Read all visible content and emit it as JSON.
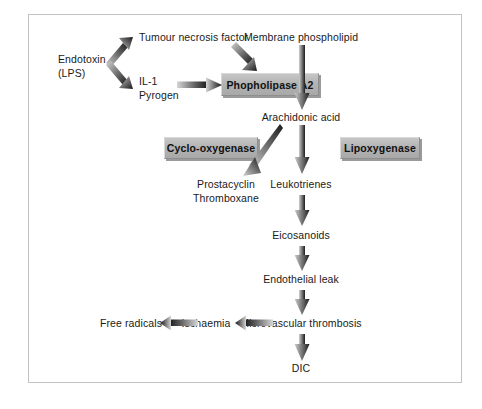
{
  "figure": {
    "type": "flowchart",
    "topic": "Inflammatory mediator cascade from endotoxin to DIC",
    "frame": {
      "border_color": "#c3c3c3",
      "background": "#ffffff"
    },
    "palette": {
      "text": "#1a1a1a",
      "box_fill": "#b4b4b4",
      "box_shadow": "#9a9a9a",
      "arrow_dark": "#1f1f1f",
      "arrow_light": "#c9c9c9"
    }
  },
  "nodes": {
    "endotoxin": {
      "line1": "Endotoxin",
      "line2": "(LPS)"
    },
    "tnf": {
      "label": "Tumour necrosis factor"
    },
    "il1": {
      "line1": "IL-1",
      "line2": "Pyrogen"
    },
    "membrane_phospholipid": {
      "label": "Membrane phospholipid"
    },
    "arachidonic_acid": {
      "label": "Arachidonic acid"
    },
    "prostacyclin": {
      "line1": "Prostacyclin",
      "line2": "Thromboxane"
    },
    "leukotrienes": {
      "label": "Leukotrienes"
    },
    "eicosanoids": {
      "label": "Eicosanoids"
    },
    "endothelial_leak": {
      "label": "Endothelial leak"
    },
    "microvascular_thrombosis": {
      "label": "Microvascular thrombosis"
    },
    "ischaemia": {
      "label": "Ischaemia"
    },
    "free_radicals": {
      "label": "Free radicals"
    },
    "dic": {
      "label": "DIC"
    }
  },
  "enzyme_boxes": {
    "phospholipase": {
      "label": "Phopholipase A2"
    },
    "cyclooxygenase": {
      "label": "Cyclo-oxygenase"
    },
    "lipoxygenase": {
      "label": "Lipoxygenase"
    }
  },
  "edges": [
    {
      "name": "endotoxin-to-tnf",
      "from": "endotoxin",
      "to": "tnf",
      "direction": "up-right"
    },
    {
      "name": "endotoxin-to-il1",
      "from": "endotoxin",
      "to": "il1",
      "direction": "down-right"
    },
    {
      "name": "tnf-to-phospholipase",
      "from": "tnf",
      "to": "phospholipase",
      "direction": "down-right"
    },
    {
      "name": "il1-to-phospholipase",
      "from": "il1",
      "to": "phospholipase",
      "direction": "right"
    },
    {
      "name": "membrane-to-arachidonic",
      "from": "membrane_phospholipid",
      "to": "arachidonic_acid",
      "direction": "down"
    },
    {
      "name": "arachidonic-to-prostacyclin",
      "from": "arachidonic_acid",
      "to": "prostacyclin",
      "direction": "down-left"
    },
    {
      "name": "arachidonic-to-leukotrienes",
      "from": "arachidonic_acid",
      "to": "leukotrienes",
      "direction": "down"
    },
    {
      "name": "leukotrienes-to-eicosanoids",
      "from": "leukotrienes",
      "to": "eicosanoids",
      "direction": "down"
    },
    {
      "name": "eicosanoids-to-endothelial-leak",
      "from": "eicosanoids",
      "to": "endothelial_leak",
      "direction": "down"
    },
    {
      "name": "endothelial-leak-to-thrombosis",
      "from": "endothelial_leak",
      "to": "microvascular_thrombosis",
      "direction": "down"
    },
    {
      "name": "thrombosis-to-ischaemia",
      "from": "microvascular_thrombosis",
      "to": "ischaemia",
      "direction": "left"
    },
    {
      "name": "ischaemia-to-free-radicals",
      "from": "ischaemia",
      "to": "free_radicals",
      "direction": "left"
    },
    {
      "name": "thrombosis-to-dic",
      "from": "microvascular_thrombosis",
      "to": "dic",
      "direction": "down"
    }
  ]
}
